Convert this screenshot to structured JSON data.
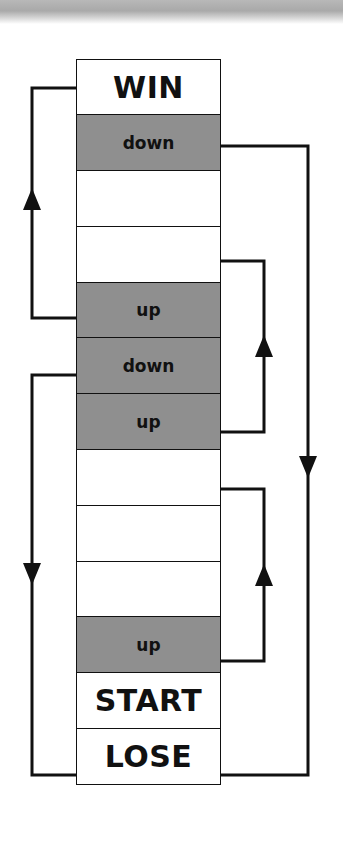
{
  "diagram": {
    "colors": {
      "line": "#111111",
      "gray_cell": "#8f8f8f",
      "white_cell": "#ffffff"
    },
    "cells": [
      {
        "index": 0,
        "label": "WIN",
        "fill": "white",
        "size": "big"
      },
      {
        "index": 1,
        "label": "down",
        "fill": "gray",
        "size": "small"
      },
      {
        "index": 2,
        "label": "",
        "fill": "white",
        "size": "small"
      },
      {
        "index": 3,
        "label": "",
        "fill": "white",
        "size": "small"
      },
      {
        "index": 4,
        "label": "up",
        "fill": "gray",
        "size": "small"
      },
      {
        "index": 5,
        "label": "down",
        "fill": "gray",
        "size": "small"
      },
      {
        "index": 6,
        "label": "up",
        "fill": "gray",
        "size": "small"
      },
      {
        "index": 7,
        "label": "",
        "fill": "white",
        "size": "small"
      },
      {
        "index": 8,
        "label": "",
        "fill": "white",
        "size": "small"
      },
      {
        "index": 9,
        "label": "",
        "fill": "white",
        "size": "small"
      },
      {
        "index": 10,
        "label": "up",
        "fill": "gray",
        "size": "small"
      },
      {
        "index": 11,
        "label": "START",
        "fill": "white",
        "size": "big"
      },
      {
        "index": 12,
        "label": "LOSE",
        "fill": "white",
        "size": "big"
      }
    ],
    "connections": [
      {
        "from": "up (row 4)",
        "to": "WIN",
        "side": "left",
        "direction": "up"
      },
      {
        "from": "down (row 1)",
        "to": "LOSE",
        "side": "right",
        "direction": "down"
      },
      {
        "from": "up (row 6)",
        "to": "row 3",
        "side": "right-inner",
        "direction": "up"
      },
      {
        "from": "down (row 5)",
        "to": "LOSE",
        "side": "left",
        "direction": "down"
      },
      {
        "from": "up (row 10)",
        "to": "row 7",
        "side": "right-inner",
        "direction": "up"
      }
    ]
  }
}
